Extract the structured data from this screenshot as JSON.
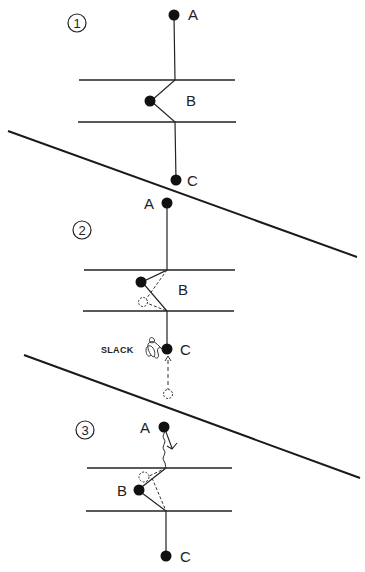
{
  "diagram": {
    "type": "belay-sequence",
    "panels": [
      {
        "step": "1",
        "labels": {
          "a": "A",
          "b": "B",
          "c": "C"
        }
      },
      {
        "step": "2",
        "labels": {
          "a": "A",
          "b": "B",
          "c": "C",
          "slack": "SLACK"
        }
      },
      {
        "step": "3",
        "labels": {
          "a": "A",
          "b": "B",
          "c": "C"
        }
      }
    ],
    "colors": {
      "ink": "#1a1a1a",
      "background": "#ffffff"
    }
  }
}
